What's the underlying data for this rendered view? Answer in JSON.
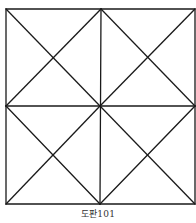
{
  "figure": {
    "caption": "도판101",
    "stroke_color": "#1a1a1a",
    "background": "#ffffff",
    "grid": {
      "rows": 2,
      "cols": 2
    }
  }
}
